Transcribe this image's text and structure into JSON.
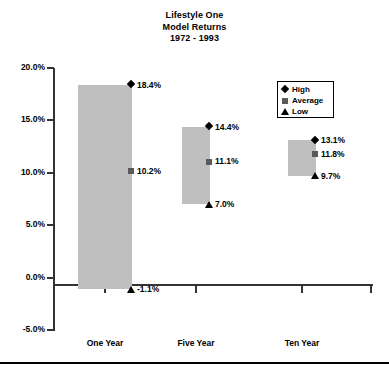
{
  "chart_data": {
    "type": "bar",
    "title": "Lifestyle One Model Returns 1972 - 1993",
    "title_lines": [
      "Lifestyle One",
      "Model Returns",
      "1972 - 1993"
    ],
    "xlabel": "",
    "ylabel": "",
    "categories": [
      "One Year",
      "Five Year",
      "Ten Year"
    ],
    "ylim": [
      -5.0,
      20.0
    ],
    "ytick_labels": [
      "20.0%",
      "15.0%",
      "10.0%",
      "5.0%",
      "0.0%",
      "-5.0%"
    ],
    "ytick_values": [
      20.0,
      15.0,
      10.0,
      5.0,
      0.0,
      -5.0
    ],
    "grid": false,
    "legend_position": "top-right",
    "bar_color": "#bfbfbf",
    "series": [
      {
        "name": "High",
        "marker": "diamond",
        "values": [
          18.4,
          14.4,
          13.1
        ],
        "labels": [
          "18.4%",
          "14.4%",
          "13.1%"
        ]
      },
      {
        "name": "Average",
        "marker": "square",
        "values": [
          10.2,
          11.1,
          11.8
        ],
        "labels": [
          "10.2%",
          "11.1%",
          "11.8%"
        ]
      },
      {
        "name": "Low",
        "marker": "triangle",
        "values": [
          -1.1,
          7.0,
          9.7
        ],
        "labels": [
          "-1.1%",
          "7.0%",
          "9.7%"
        ]
      }
    ]
  },
  "legend": {
    "items": [
      {
        "label": "High",
        "marker": "diamond"
      },
      {
        "label": "Average",
        "marker": "square"
      },
      {
        "label": "Low",
        "marker": "triangle"
      }
    ]
  }
}
